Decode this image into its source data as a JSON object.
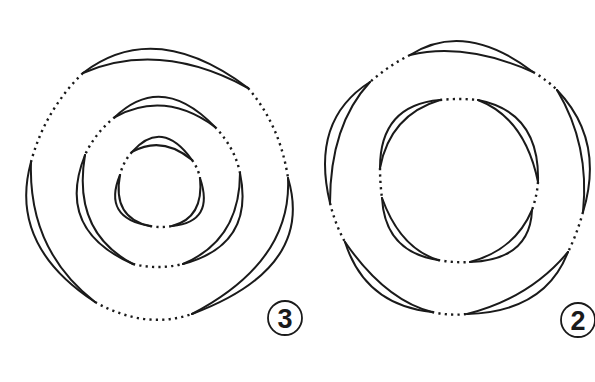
{
  "figures": [
    {
      "id": "figure-3",
      "label": "3",
      "rings": 3,
      "crescents_per_ring": 3,
      "description": "Three concentric rings, each with three crescent-shaped lobes joined by dotted segments"
    },
    {
      "id": "figure-2",
      "label": "2",
      "rings": 2,
      "crescents_per_ring": [
        5,
        4
      ],
      "description": "Two concentric rings; outer with five crescent lobes, inner with four, joined by dotted segments"
    }
  ],
  "colors": {
    "line": "#1a1a1a",
    "background": "#ffffff"
  }
}
